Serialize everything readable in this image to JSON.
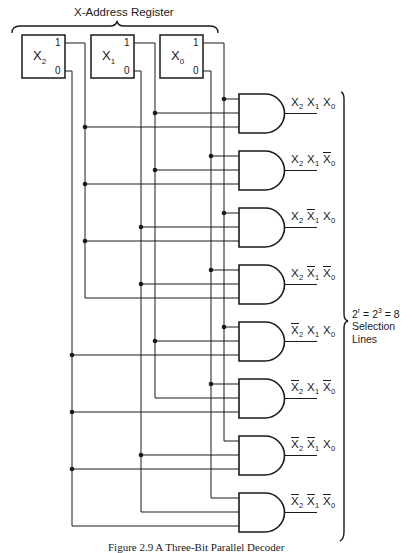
{
  "title": "X-Address Register",
  "registers": [
    {
      "name": "X",
      "sub": "2",
      "pin_one": "1",
      "pin_zero": "0"
    },
    {
      "name": "X",
      "sub": "1",
      "pin_one": "1",
      "pin_zero": "0"
    },
    {
      "name": "X",
      "sub": "0",
      "pin_one": "1",
      "pin_zero": "0"
    }
  ],
  "gates": [
    {
      "label": "X2 X1 X0",
      "terms": [
        {
          "v": "X",
          "s": "2",
          "bar": false
        },
        {
          "v": "X",
          "s": "1",
          "bar": false
        },
        {
          "v": "X",
          "s": "0",
          "bar": false
        }
      ]
    },
    {
      "label": "X2 X1 X0'",
      "terms": [
        {
          "v": "X",
          "s": "2",
          "bar": false
        },
        {
          "v": "X",
          "s": "1",
          "bar": false
        },
        {
          "v": "X",
          "s": "0",
          "bar": true
        }
      ]
    },
    {
      "label": "X2 X1' X0",
      "terms": [
        {
          "v": "X",
          "s": "2",
          "bar": false
        },
        {
          "v": "X",
          "s": "1",
          "bar": true
        },
        {
          "v": "X",
          "s": "0",
          "bar": false
        }
      ]
    },
    {
      "label": "X2 X1' X0'",
      "terms": [
        {
          "v": "X",
          "s": "2",
          "bar": false
        },
        {
          "v": "X",
          "s": "1",
          "bar": true
        },
        {
          "v": "X",
          "s": "0",
          "bar": true
        }
      ]
    },
    {
      "label": "X2' X1 X0",
      "terms": [
        {
          "v": "X",
          "s": "2",
          "bar": true
        },
        {
          "v": "X",
          "s": "1",
          "bar": false
        },
        {
          "v": "X",
          "s": "0",
          "bar": false
        }
      ]
    },
    {
      "label": "X2' X1 X0'",
      "terms": [
        {
          "v": "X",
          "s": "2",
          "bar": true
        },
        {
          "v": "X",
          "s": "1",
          "bar": false
        },
        {
          "v": "X",
          "s": "0",
          "bar": true
        }
      ]
    },
    {
      "label": "X2' X1' X0",
      "terms": [
        {
          "v": "X",
          "s": "2",
          "bar": true
        },
        {
          "v": "X",
          "s": "1",
          "bar": true
        },
        {
          "v": "X",
          "s": "0",
          "bar": false
        }
      ]
    },
    {
      "label": "X2' X1' X0'",
      "terms": [
        {
          "v": "X",
          "s": "2",
          "bar": true
        },
        {
          "v": "X",
          "s": "1",
          "bar": true
        },
        {
          "v": "X",
          "s": "0",
          "bar": true
        }
      ]
    }
  ],
  "selection": {
    "formula_base": "2",
    "formula_exp_r": "r",
    "formula_mid": " = 2",
    "formula_exp_3": "3",
    "formula_end": " = 8",
    "line2": "Selection",
    "line3": "Lines"
  },
  "caption": "Figure 2.9   A Three-Bit Parallel Decoder",
  "colors": {
    "line": "#1a1a1a",
    "background": "#ffffff"
  }
}
